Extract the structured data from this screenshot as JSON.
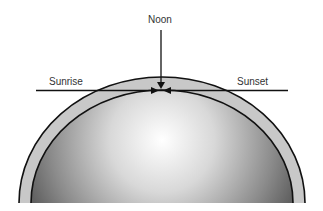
{
  "diagram": {
    "labels": {
      "noon": "Noon",
      "sunrise": "Sunrise",
      "sunset": "Sunset"
    },
    "colors": {
      "background": "#ffffff",
      "atmosphere": "#c8c8c8",
      "earth_center": "#ffffff",
      "earth_edge": "#5a5a5a",
      "lines": "#111111",
      "text": "#333333"
    }
  }
}
